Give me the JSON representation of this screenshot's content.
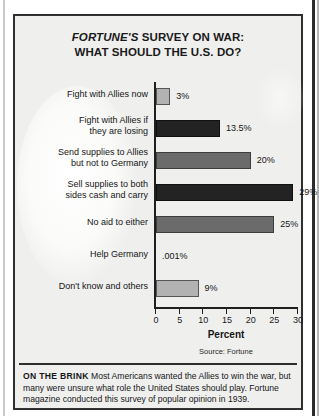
{
  "figure": {
    "title_line1": "FORTUNE'S SURVEY ON WAR:",
    "title_line1_italic": "FORTUNE'S",
    "title_line1_rest": " SURVEY ON WAR:",
    "title_line2": "WHAT SHOULD THE U.S. DO?",
    "source": "Source: Fortune"
  },
  "caption": {
    "lead": "ON THE BRINK",
    "body": "Most Americans wanted the Allies to win the war, but many were unsure what role the United States should play. Fortune magazine conducted this survey of popular opinion in 1939."
  },
  "chart_data": {
    "type": "bar",
    "orientation": "horizontal",
    "title": "FORTUNE'S SURVEY ON WAR: WHAT SHOULD THE U.S. DO?",
    "xlabel": "Percent",
    "ylabel": "",
    "xlim": [
      0,
      30
    ],
    "xticks": [
      0,
      5,
      10,
      15,
      20,
      25,
      30
    ],
    "xtick_labels": [
      "0",
      "5",
      "10",
      "15",
      "20",
      "25",
      "30"
    ],
    "grid": false,
    "legend": false,
    "source": "Source: Fortune",
    "categories": [
      "Fight with Allies now",
      "Fight with Allies if they are losing",
      "Send supplies to Allies but not to Germany",
      "Sell supplies to both sides cash and carry",
      "No aid to either",
      "Help Germany",
      "Don't know and others"
    ],
    "values": [
      3,
      13.5,
      20,
      29,
      25,
      0.001,
      9
    ],
    "value_labels": [
      "3%",
      "13.5%",
      "20%",
      "29%",
      "25%",
      ".001%",
      "9%"
    ],
    "bar_colors": [
      "#b2b2b2",
      "#232323",
      "#6b6b6b",
      "#232323",
      "#6b6b6b",
      "#b2b2b2",
      "#b2b2b2"
    ],
    "bars": [
      {
        "label_line1": "Fight with Allies now",
        "label_line2": "",
        "value": 3,
        "value_label": "3%",
        "shade": "light"
      },
      {
        "label_line1": "Fight with Allies if",
        "label_line2": "they are losing",
        "value": 13.5,
        "value_label": "13.5%",
        "shade": "dark"
      },
      {
        "label_line1": "Send supplies to Allies",
        "label_line2": "but not to Germany",
        "value": 20,
        "value_label": "20%",
        "shade": "mid"
      },
      {
        "label_line1": "Sell supplies to both",
        "label_line2": "sides cash and carry",
        "value": 29,
        "value_label": "29%",
        "shade": "dark"
      },
      {
        "label_line1": "No aid to either",
        "label_line2": "",
        "value": 25,
        "value_label": "25%",
        "shade": "mid"
      },
      {
        "label_line1": "Help Germany",
        "label_line2": "",
        "value": 0.001,
        "value_label": ".001%",
        "shade": "none"
      },
      {
        "label_line1": "Don't know and others",
        "label_line2": "",
        "value": 9,
        "value_label": "9%",
        "shade": "light"
      }
    ]
  }
}
